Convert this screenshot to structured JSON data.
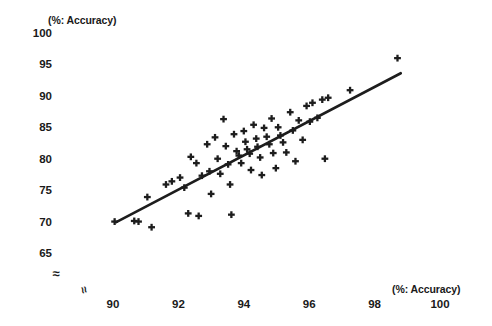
{
  "chart_data": {
    "type": "scatter",
    "title": "",
    "xlabel": "(%: Accuracy)",
    "ylabel": "(%: Accuracy)",
    "xlim": [
      89.2,
      100.6
    ],
    "ylim": [
      63.5,
      101.5
    ],
    "xticks": [
      90,
      92,
      94,
      96,
      98,
      100
    ],
    "xtick_labels": [
      "90",
      "92",
      "94",
      "96",
      "98",
      "100"
    ],
    "yticks": [
      65,
      70,
      75,
      80,
      85,
      90,
      95,
      100
    ],
    "ytick_labels": [
      "65",
      "70",
      "75",
      "80",
      "85",
      "90",
      "95",
      "100"
    ],
    "grid": false,
    "legend": null,
    "axis_break_x": "≈",
    "axis_break_y": "≈",
    "marker": "plus",
    "marker_color": "#1d1d1d",
    "points": [
      [
        90.05,
        70.0
      ],
      [
        90.65,
        70.1
      ],
      [
        90.78,
        70.0
      ],
      [
        91.05,
        73.9
      ],
      [
        91.18,
        69.1
      ],
      [
        91.62,
        75.9
      ],
      [
        91.8,
        76.4
      ],
      [
        92.05,
        77.0
      ],
      [
        92.18,
        75.4
      ],
      [
        92.3,
        71.3
      ],
      [
        92.38,
        80.3
      ],
      [
        92.55,
        79.3
      ],
      [
        92.62,
        70.9
      ],
      [
        92.72,
        77.3
      ],
      [
        92.88,
        82.3
      ],
      [
        92.95,
        78.0
      ],
      [
        93.0,
        74.4
      ],
      [
        93.12,
        83.4
      ],
      [
        93.2,
        80.0
      ],
      [
        93.28,
        77.6
      ],
      [
        93.38,
        86.3
      ],
      [
        93.45,
        82.0
      ],
      [
        93.52,
        79.1
      ],
      [
        93.58,
        75.9
      ],
      [
        93.62,
        71.1
      ],
      [
        93.7,
        83.9
      ],
      [
        93.78,
        81.2
      ],
      [
        93.85,
        80.5
      ],
      [
        93.92,
        79.3
      ],
      [
        94.0,
        84.4
      ],
      [
        94.05,
        82.7
      ],
      [
        94.1,
        81.5
      ],
      [
        94.18,
        80.8
      ],
      [
        94.22,
        78.2
      ],
      [
        94.3,
        85.4
      ],
      [
        94.38,
        83.2
      ],
      [
        94.42,
        81.9
      ],
      [
        94.5,
        80.2
      ],
      [
        94.55,
        77.4
      ],
      [
        94.62,
        84.9
      ],
      [
        94.7,
        83.5
      ],
      [
        94.78,
        82.3
      ],
      [
        94.85,
        86.4
      ],
      [
        94.9,
        80.9
      ],
      [
        94.98,
        78.5
      ],
      [
        95.05,
        85.0
      ],
      [
        95.12,
        83.7
      ],
      [
        95.2,
        82.6
      ],
      [
        95.3,
        81.0
      ],
      [
        95.42,
        87.4
      ],
      [
        95.5,
        84.5
      ],
      [
        95.58,
        79.6
      ],
      [
        95.68,
        86.1
      ],
      [
        95.8,
        83.0
      ],
      [
        95.92,
        88.4
      ],
      [
        96.02,
        85.9
      ],
      [
        96.1,
        88.9
      ],
      [
        96.25,
        86.5
      ],
      [
        96.4,
        89.4
      ],
      [
        96.48,
        80.0
      ],
      [
        96.58,
        89.7
      ],
      [
        97.25,
        90.9
      ],
      [
        98.7,
        96.0
      ]
    ],
    "trend_line": {
      "x": [
        90.1,
        98.8
      ],
      "y": [
        69.9,
        93.6
      ],
      "color": "#1d1d1d"
    }
  }
}
